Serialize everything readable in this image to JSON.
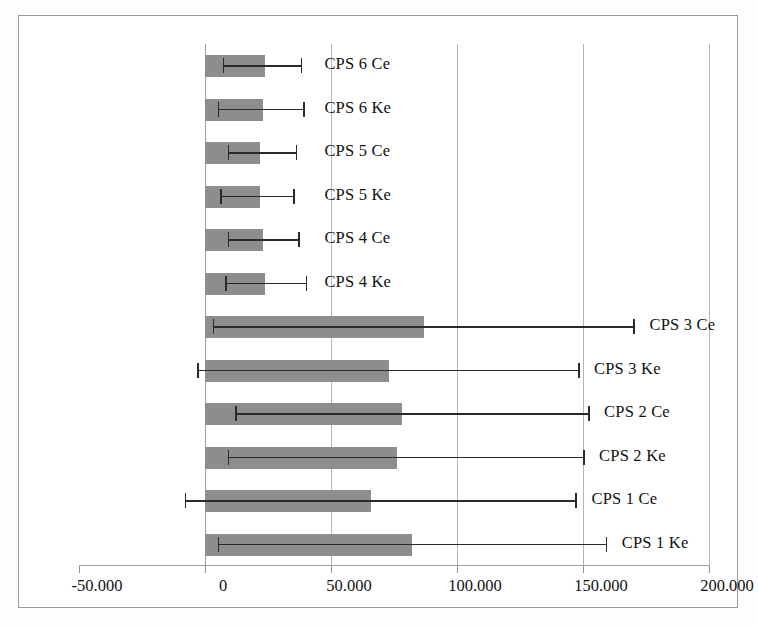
{
  "chart_data": {
    "type": "bar",
    "orientation": "horizontal",
    "title": "",
    "xlabel": "",
    "ylabel": "",
    "xlim": [
      -50,
      200
    ],
    "grid": true,
    "legend": false,
    "error_bars": true,
    "bar_color": "#8d8d8d",
    "error_color": "#2a2a2a",
    "gridline_color": "#b6b6b6",
    "frame_color": "#9a9a9a",
    "xticks": [
      -50,
      0,
      50,
      100,
      150,
      200
    ],
    "xtick_labels": [
      "-50.000",
      "0",
      "50.000",
      "100.000",
      "150.000",
      "200.000"
    ],
    "categories": [
      "CPS 6 Ce",
      "CPS 6 Ke",
      "CPS 5 Ce",
      "CPS 5 Ke",
      "CPS 4 Ce",
      "CPS 4 Ke",
      "CPS 3 Ce",
      "CPS 3 Ke",
      "CPS 2 Ce",
      "CPS 2 Ke",
      "CPS 1 Ce",
      "CPS 1 Ke"
    ],
    "values": [
      24,
      23,
      22,
      22,
      23,
      24,
      87,
      73,
      78,
      76,
      66,
      82
    ],
    "error_low": [
      7,
      5,
      9,
      6,
      9,
      8,
      3,
      -3,
      12,
      9,
      -8,
      5
    ],
    "error_high": [
      38,
      39,
      36,
      35,
      37,
      40,
      170,
      148,
      152,
      150,
      147,
      159
    ],
    "bars": [
      {
        "label": "CPS 6 Ce",
        "value": 24,
        "err_low": 7,
        "err_high": 38,
        "label_x": 45
      },
      {
        "label": "CPS 6 Ke",
        "value": 23,
        "err_low": 5,
        "err_high": 39,
        "label_x": 45
      },
      {
        "label": "CPS 5 Ce",
        "value": 22,
        "err_low": 9,
        "err_high": 36,
        "label_x": 45
      },
      {
        "label": "CPS 5 Ke",
        "value": 22,
        "err_low": 6,
        "err_high": 35,
        "label_x": 45
      },
      {
        "label": "CPS 4 Ce",
        "value": 23,
        "err_low": 9,
        "err_high": 37,
        "label_x": 45
      },
      {
        "label": "CPS 4 Ke",
        "value": 24,
        "err_low": 8,
        "err_high": 40,
        "label_x": 45
      },
      {
        "label": "CPS 3 Ce",
        "value": 87,
        "err_low": 3,
        "err_high": 170,
        "label_x": 174
      },
      {
        "label": "CPS 3 Ke",
        "value": 73,
        "err_low": -3,
        "err_high": 148,
        "label_x": 152
      },
      {
        "label": "CPS 2 Ce",
        "value": 78,
        "err_low": 12,
        "err_high": 152,
        "label_x": 156
      },
      {
        "label": "CPS 2 Ke",
        "value": 76,
        "err_low": 9,
        "err_high": 150,
        "label_x": 154
      },
      {
        "label": "CPS 1 Ce",
        "value": 66,
        "err_low": -8,
        "err_high": 147,
        "label_x": 151
      },
      {
        "label": "CPS 1 Ke",
        "value": 82,
        "err_low": 5,
        "err_high": 159,
        "label_x": 163
      }
    ]
  }
}
